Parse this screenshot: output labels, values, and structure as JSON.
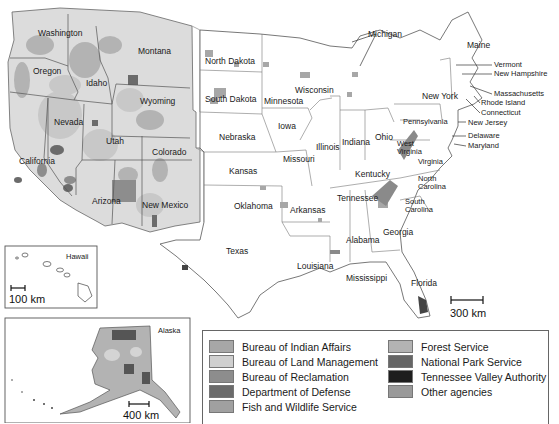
{
  "map": {
    "title": "Federal lands by managing agency",
    "background": "#ffffff",
    "colors": {
      "bia": "#a7a7a7",
      "blm": "#cfcfcf",
      "bor": "#8d8d8d",
      "dod": "#6b6b6b",
      "fws": "#a0a0a0",
      "fs": "#b3b3b3",
      "nps": "#666666",
      "tva": "#1e1e1e",
      "other": "#9a9a9a"
    },
    "states": [
      {
        "name": "Washington",
        "x": 38,
        "y": 29
      },
      {
        "name": "Oregon",
        "x": 32,
        "y": 67
      },
      {
        "name": "Idaho",
        "x": 86,
        "y": 79
      },
      {
        "name": "Montana",
        "x": 138,
        "y": 47
      },
      {
        "name": "Wyoming",
        "x": 140,
        "y": 97
      },
      {
        "name": "Nevada",
        "x": 53,
        "y": 118
      },
      {
        "name": "Utah",
        "x": 105,
        "y": 137
      },
      {
        "name": "Colorado",
        "x": 152,
        "y": 148
      },
      {
        "name": "California",
        "x": 19,
        "y": 157
      },
      {
        "name": "Arizona",
        "x": 92,
        "y": 197
      },
      {
        "name": "New Mexico",
        "x": 142,
        "y": 201
      },
      {
        "name": "North Dakota",
        "x": 205,
        "y": 56
      },
      {
        "name": "South Dakota",
        "x": 204,
        "y": 94
      },
      {
        "name": "Nebraska",
        "x": 219,
        "y": 133
      },
      {
        "name": "Kansas",
        "x": 228,
        "y": 167
      },
      {
        "name": "Oklahoma",
        "x": 233,
        "y": 202
      },
      {
        "name": "Texas",
        "x": 226,
        "y": 247
      },
      {
        "name": "Minnesota",
        "x": 263,
        "y": 97
      },
      {
        "name": "Iowa",
        "x": 278,
        "y": 122
      },
      {
        "name": "Missouri",
        "x": 283,
        "y": 155
      },
      {
        "name": "Arkansas",
        "x": 290,
        "y": 206
      },
      {
        "name": "Louisiana",
        "x": 297,
        "y": 262
      },
      {
        "name": "Wisconsin",
        "x": 295,
        "y": 86
      },
      {
        "name": "Illinois",
        "x": 316,
        "y": 143
      },
      {
        "name": "Indiana",
        "x": 342,
        "y": 138
      },
      {
        "name": "Ohio",
        "x": 375,
        "y": 133
      },
      {
        "name": "Kentucky",
        "x": 354,
        "y": 170
      },
      {
        "name": "Tennessee",
        "x": 337,
        "y": 194
      },
      {
        "name": "Mississippi",
        "x": 346,
        "y": 274
      },
      {
        "name": "Alabama",
        "x": 346,
        "y": 236
      },
      {
        "name": "Georgia",
        "x": 383,
        "y": 228
      },
      {
        "name": "Florida",
        "x": 410,
        "y": 279
      },
      {
        "name": "South Carolina",
        "x": 405,
        "y": 198
      },
      {
        "name": "North Carolina",
        "x": 418,
        "y": 175
      },
      {
        "name": "Virginia",
        "x": 419,
        "y": 158
      },
      {
        "name": "West Virginia",
        "x": 397,
        "y": 142
      },
      {
        "name": "Pennsylvania",
        "x": 403,
        "y": 118
      },
      {
        "name": "New York",
        "x": 422,
        "y": 92
      },
      {
        "name": "Maine",
        "x": 467,
        "y": 44
      },
      {
        "name": "Michigan",
        "x": 368,
        "y": 30
      }
    ],
    "callouts": [
      {
        "name": "Vermont",
        "x": 494,
        "y": 64
      },
      {
        "name": "New Hampshire",
        "x": 494,
        "y": 73
      },
      {
        "name": "Massachusetts",
        "x": 494,
        "y": 93
      },
      {
        "name": "Rhode Island",
        "x": 481,
        "y": 102
      },
      {
        "name": "Connecticut",
        "x": 481,
        "y": 112
      },
      {
        "name": "New Jersey",
        "x": 468,
        "y": 122
      },
      {
        "name": "Delaware",
        "x": 468,
        "y": 135
      },
      {
        "name": "Maryland",
        "x": 468,
        "y": 145
      }
    ],
    "scale_main": "300 km",
    "hawaii": {
      "label": "Hawaii",
      "scale": "100 km"
    },
    "alaska": {
      "label": "Alaska",
      "scale": "400 km"
    }
  },
  "legend": {
    "items": [
      {
        "label": "Bureau of Indian Affairs",
        "color": "#a7a7a7"
      },
      {
        "label": "Bureau of Land Management",
        "color": "#cfcfcf"
      },
      {
        "label": "Bureau of Reclamation",
        "color": "#8d8d8d"
      },
      {
        "label": "Department of Defense",
        "color": "#6b6b6b"
      },
      {
        "label": "Fish and Wildlife Service",
        "color": "#a0a0a0"
      },
      {
        "label": "Forest Service",
        "color": "#b3b3b3"
      },
      {
        "label": "National Park Service",
        "color": "#666666"
      },
      {
        "label": "Tennessee Valley Authority",
        "color": "#1e1e1e"
      },
      {
        "label": "Other agencies",
        "color": "#9a9a9a"
      }
    ]
  }
}
